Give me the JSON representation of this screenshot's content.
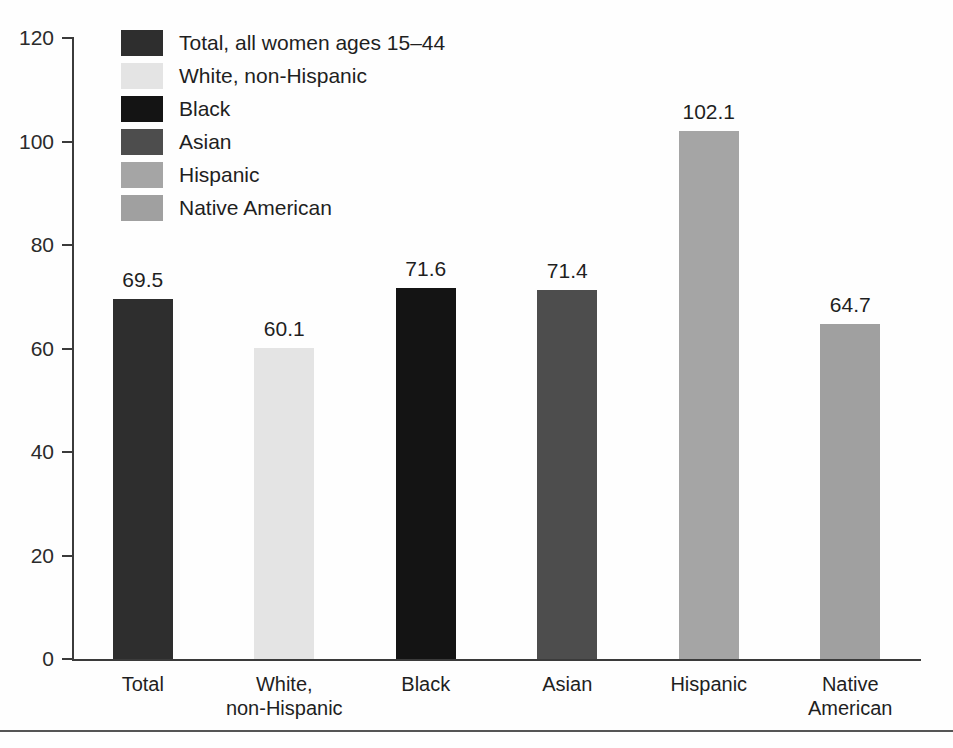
{
  "chart_data": {
    "type": "bar",
    "title": "",
    "subtitle": "",
    "xlabel": "",
    "ylabel": "",
    "ylim": [
      0,
      120
    ],
    "grid": false,
    "legend_position": "inside-top-left",
    "categories": [
      "Total",
      "White, non-Hispanic",
      "Black",
      "Asian",
      "Hispanic",
      "Native American"
    ],
    "category_label_lines": [
      [
        "Total"
      ],
      [
        "White,",
        "non-Hispanic"
      ],
      [
        "Black"
      ],
      [
        "Asian"
      ],
      [
        "Hispanic"
      ],
      [
        "Native",
        "American"
      ]
    ],
    "values": [
      69.5,
      60.1,
      71.6,
      71.4,
      102.1,
      64.7
    ],
    "value_labels": [
      "69.5",
      "60.1",
      "71.6",
      "71.4",
      "102.1",
      "64.7"
    ],
    "yticks": [
      0,
      20,
      40,
      60,
      80,
      100,
      120
    ],
    "ytick_labels": [
      "0",
      "20",
      "40",
      "60",
      "80",
      "100",
      "120"
    ],
    "colors": [
      "#2e2e2e",
      "#e4e4e4",
      "#141414",
      "#4d4d4d",
      "#a5a5a5",
      "#a0a0a0"
    ],
    "legend": [
      {
        "label": "Total, all women ages 15–44",
        "color": "#2e2e2e"
      },
      {
        "label": "White, non-Hispanic",
        "color": "#e4e4e4"
      },
      {
        "label": "Black",
        "color": "#141414"
      },
      {
        "label": "Asian",
        "color": "#4d4d4d"
      },
      {
        "label": "Hispanic",
        "color": "#a5a5a5"
      },
      {
        "label": "Native American",
        "color": "#a0a0a0"
      }
    ]
  },
  "axis": {
    "line_color": "#3b3b3b"
  },
  "footer": {
    "rule_color": "#555555"
  }
}
